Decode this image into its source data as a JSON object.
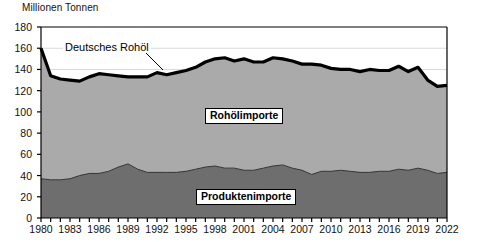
{
  "chart_data": {
    "type": "area",
    "title": "Millionen Tonnen",
    "subtitle": "",
    "xlabel": "",
    "ylabel": "Millionen Tonnen",
    "ylim": [
      0,
      180
    ],
    "ytick_step": 20,
    "yticks": [
      0,
      20,
      40,
      60,
      80,
      100,
      120,
      140,
      160,
      180
    ],
    "xticks": [
      1980,
      1983,
      1986,
      1989,
      1992,
      1995,
      1998,
      2001,
      2004,
      2007,
      2010,
      2013,
      2016,
      2019,
      2022
    ],
    "grid": true,
    "legend_position": "inline-annotations",
    "stacked": true,
    "x": [
      1980,
      1981,
      1982,
      1983,
      1984,
      1985,
      1986,
      1987,
      1988,
      1989,
      1990,
      1991,
      1992,
      1993,
      1994,
      1995,
      1996,
      1997,
      1998,
      1999,
      2000,
      2001,
      2002,
      2003,
      2004,
      2005,
      2006,
      2007,
      2008,
      2009,
      2010,
      2011,
      2012,
      2013,
      2014,
      2015,
      2016,
      2017,
      2018,
      2019,
      2020,
      2021,
      2022
    ],
    "series": [
      {
        "name": "Produktenimporte",
        "color": "#6e6e6e",
        "values": [
          37,
          36,
          36,
          37,
          40,
          42,
          42,
          44,
          48,
          51,
          46,
          43,
          43,
          43,
          43,
          44,
          46,
          48,
          49,
          47,
          47,
          45,
          45,
          47,
          49,
          50,
          47,
          45,
          41,
          44,
          44,
          45,
          44,
          43,
          43,
          44,
          44,
          46,
          45,
          47,
          45,
          42,
          43
        ]
      },
      {
        "name": "Rohölimporte",
        "color": "#aaaaaa",
        "values": [
          123,
          98,
          95,
          93,
          89,
          91,
          94,
          91,
          86,
          82,
          87,
          90,
          94,
          92,
          94,
          95,
          96,
          99,
          101,
          104,
          101,
          105,
          102,
          100,
          102,
          100,
          101,
          100,
          104,
          100,
          97,
          95,
          96,
          95,
          97,
          95,
          95,
          97,
          93,
          95,
          85,
          82,
          82
        ]
      }
    ],
    "total_line": {
      "name": "Deutsches Rohöl",
      "color": "#000000",
      "description": "Bold black upper boundary line of the stacked area (total imports)",
      "values": [
        160,
        134,
        131,
        130,
        129,
        133,
        136,
        135,
        134,
        133,
        133,
        133,
        137,
        135,
        137,
        139,
        142,
        147,
        150,
        151,
        148,
        150,
        147,
        147,
        151,
        150,
        148,
        145,
        145,
        144,
        141,
        140,
        140,
        138,
        140,
        139,
        139,
        143,
        138,
        142,
        130,
        124,
        125
      ]
    },
    "annotations": [
      {
        "text": "Deutsches Rohöl",
        "kind": "callout-label"
      },
      {
        "text": "Rohölimporte",
        "kind": "series-box-label"
      },
      {
        "text": "Produktenimporte",
        "kind": "series-box-label"
      }
    ]
  },
  "colors": {
    "lower_area": "#6e6e6e",
    "upper_area": "#aaaaaa",
    "line": "#000000",
    "axis": "#000000",
    "grid": "#d9d9d9",
    "background": "#ffffff"
  }
}
